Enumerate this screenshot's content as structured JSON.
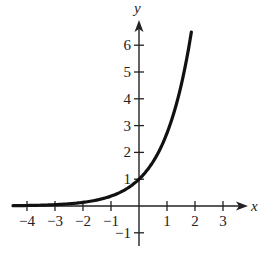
{
  "chart_data": {
    "type": "line",
    "title": "",
    "function": "y = e^x",
    "xlabel": "x",
    "ylabel": "y",
    "xlim": [
      -4.5,
      3.8
    ],
    "ylim": [
      -1.5,
      7
    ],
    "x_ticks": [
      -4,
      -3,
      -2,
      -1,
      1,
      2,
      3
    ],
    "y_ticks": [
      -1,
      1,
      2,
      3,
      4,
      5,
      6
    ],
    "x_tick_labels": [
      "−4",
      "−3",
      "−2",
      "−1",
      "1",
      "2",
      "3"
    ],
    "y_tick_labels": [
      "−1",
      "1",
      "2",
      "3",
      "4",
      "5",
      "6"
    ],
    "grid": false,
    "legend": null,
    "series": [
      {
        "name": "e^x",
        "x": [
          -4.5,
          -4,
          -3,
          -2,
          -1,
          0,
          0.5,
          1,
          1.5,
          1.87
        ],
        "y": [
          0.011,
          0.018,
          0.05,
          0.135,
          0.368,
          1,
          1.649,
          2.718,
          4.482,
          6.5
        ]
      }
    ],
    "colors": {
      "curve": "#111111",
      "axes": "#222222"
    }
  }
}
